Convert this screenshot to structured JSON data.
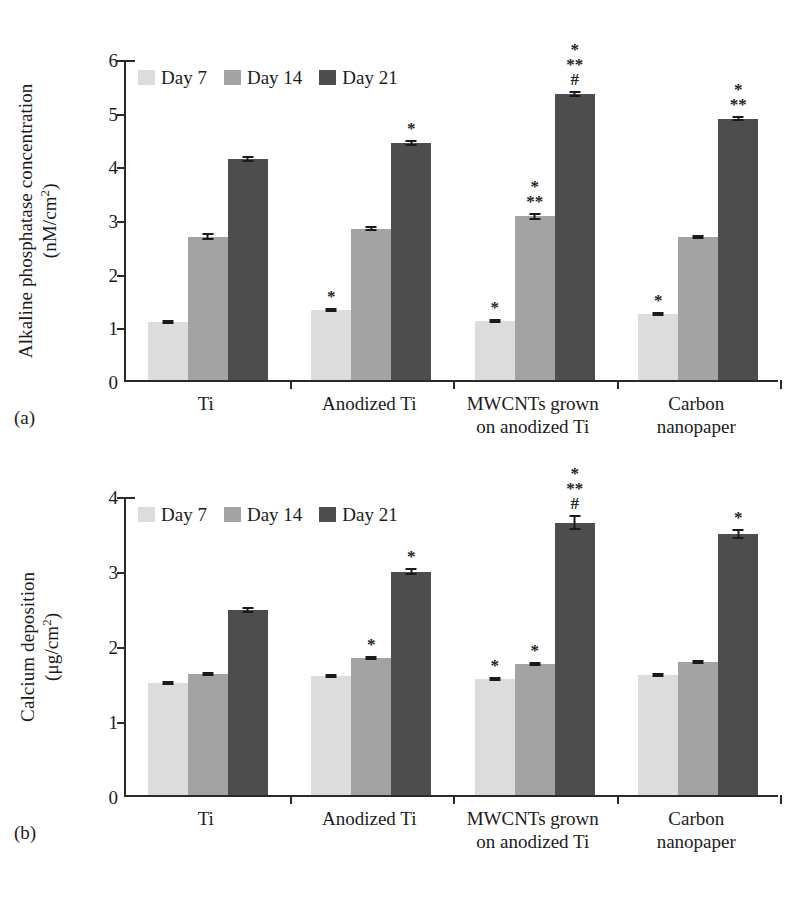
{
  "figure": {
    "panels": [
      {
        "tag": "(a)",
        "ylabel_line1": "Alkaline phosphatase concentration",
        "ylabel_line2": "(nM/cm",
        "ylabel_sup": "2",
        "ylabel_tail": ")"
      },
      {
        "tag": "(b)",
        "ylabel_line1": "Calcium deposition",
        "ylabel_line2": "(μg/cm",
        "ylabel_sup": "2",
        "ylabel_tail": ")"
      }
    ]
  },
  "legend": {
    "items": [
      {
        "label": "Day 7",
        "color": "#dcdcdc"
      },
      {
        "label": "Day 14",
        "color": "#a3a3a3"
      },
      {
        "label": "Day 21",
        "color": "#4d4d4d"
      }
    ]
  },
  "colors": {
    "day7": "#dcdcdc",
    "day14": "#a3a3a3",
    "day21": "#4d4d4d",
    "axis": "#2a2a2a",
    "text": "#1b1b1b"
  },
  "chart_data": [
    {
      "type": "bar",
      "panel": "(a)",
      "title": "",
      "xlabel": "",
      "ylabel": "Alkaline phosphatase concentration (nM/cm2)",
      "ylim": [
        0,
        6
      ],
      "yticks": [
        0,
        1,
        2,
        3,
        4,
        5,
        6
      ],
      "ytick_labels": [
        "0",
        "1",
        "2",
        "3",
        "4",
        "5",
        "6"
      ],
      "grid": false,
      "legend_position": "top-left",
      "categories": [
        "Ti",
        "Anodized Ti",
        "MWCNTs grown on anodized Ti",
        "Carbon nanopaper"
      ],
      "category_lines": [
        [
          "Ti"
        ],
        [
          "Anodized Ti"
        ],
        [
          "MWCNTs grown",
          "on anodized Ti"
        ],
        [
          "Carbon",
          "nanopaper"
        ]
      ],
      "series": [
        {
          "name": "Day 7",
          "values": [
            1.08,
            1.3,
            1.1,
            1.23
          ],
          "errors": [
            0.03,
            0.04,
            0.04,
            0.03
          ],
          "annotations": [
            "",
            "*",
            "*",
            "*"
          ]
        },
        {
          "name": "Day 14",
          "values": [
            2.67,
            2.82,
            3.05,
            2.67
          ],
          "errors": [
            0.07,
            0.05,
            0.06,
            0.03
          ],
          "annotations": [
            "",
            "",
            "*\n**",
            ""
          ]
        },
        {
          "name": "Day 21",
          "values": [
            4.12,
            4.42,
            5.33,
            4.87
          ],
          "errors": [
            0.06,
            0.06,
            0.05,
            0.05
          ],
          "annotations": [
            "",
            "*",
            "*\n**\n#",
            "*\n**"
          ]
        }
      ]
    },
    {
      "type": "bar",
      "panel": "(b)",
      "title": "",
      "xlabel": "",
      "ylabel": "Calcium deposition (μg/cm2)",
      "ylim": [
        0,
        4
      ],
      "yticks": [
        0,
        1,
        2,
        3,
        4
      ],
      "ytick_labels": [
        "0",
        "1",
        "2",
        "3",
        "4"
      ],
      "grid": false,
      "legend_position": "top-left",
      "categories": [
        "Ti",
        "Anodized Ti",
        "MWCNTs grown on anodized Ti",
        "Carbon nanopaper"
      ],
      "category_lines": [
        [
          "Ti"
        ],
        [
          "Anodized Ti"
        ],
        [
          "MWCNTs grown",
          "on anodized Ti"
        ],
        [
          "Carbon",
          "nanopaper"
        ]
      ],
      "series": [
        {
          "name": "Day 7",
          "values": [
            1.49,
            1.59,
            1.55,
            1.6
          ],
          "errors": [
            0.02,
            0.02,
            0.03,
            0.02
          ],
          "annotations": [
            "",
            "",
            "*",
            ""
          ]
        },
        {
          "name": "Day 14",
          "values": [
            1.61,
            1.83,
            1.75,
            1.77
          ],
          "errors": [
            0.02,
            0.02,
            0.03,
            0.02
          ],
          "annotations": [
            "",
            "*",
            "*",
            ""
          ]
        },
        {
          "name": "Day 21",
          "values": [
            2.47,
            2.98,
            3.63,
            3.48
          ],
          "errors": [
            0.04,
            0.05,
            0.1,
            0.07
          ],
          "annotations": [
            "",
            "*",
            "*\n**\n#",
            "*"
          ]
        }
      ]
    }
  ]
}
